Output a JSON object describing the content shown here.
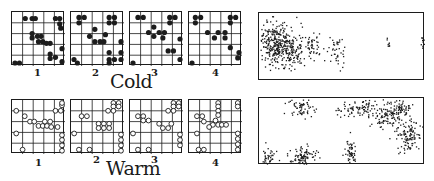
{
  "figure": {
    "panels": [
      {
        "condition": "Cold",
        "label": "Cold",
        "marker": "filled",
        "grids": [
          {
            "number": "1",
            "dots": [
              [
                0.25,
                0.12
              ],
              [
                0.38,
                0.12
              ],
              [
                0.44,
                0.12
              ],
              [
                0.82,
                0.12
              ],
              [
                0.9,
                0.12
              ],
              [
                0.9,
                0.22
              ],
              [
                0.92,
                0.3
              ],
              [
                0.38,
                0.4
              ],
              [
                0.38,
                0.48
              ],
              [
                0.48,
                0.45
              ],
              [
                0.55,
                0.45
              ],
              [
                0.5,
                0.55
              ],
              [
                0.58,
                0.55
              ],
              [
                0.65,
                0.58
              ],
              [
                0.72,
                0.58
              ],
              [
                0.96,
                0.68
              ],
              [
                0.72,
                0.78
              ],
              [
                0.72,
                0.86
              ],
              [
                0.82,
                0.84
              ],
              [
                0.96,
                0.92
              ],
              [
                0.05,
                0.96
              ],
              [
                0.14,
                0.96
              ]
            ]
          },
          {
            "number": "2",
            "dots": [
              [
                0.15,
                0.1
              ],
              [
                0.25,
                0.1
              ],
              [
                0.15,
                0.2
              ],
              [
                0.72,
                0.1
              ],
              [
                0.82,
                0.1
              ],
              [
                0.72,
                0.2
              ],
              [
                0.82,
                0.2
              ],
              [
                0.45,
                0.32
              ],
              [
                0.35,
                0.45
              ],
              [
                0.45,
                0.55
              ],
              [
                0.55,
                0.55
              ],
              [
                0.62,
                0.55
              ],
              [
                0.65,
                0.42
              ],
              [
                0.95,
                0.55
              ],
              [
                0.72,
                0.75
              ],
              [
                0.95,
                0.75
              ],
              [
                0.05,
                0.88
              ],
              [
                0.12,
                0.96
              ],
              [
                0.72,
                0.88
              ],
              [
                0.72,
                0.96
              ],
              [
                0.82,
                0.88
              ],
              [
                0.95,
                0.88
              ]
            ]
          },
          {
            "number": "3",
            "dots": [
              [
                0.15,
                0.1
              ],
              [
                0.25,
                0.1
              ],
              [
                0.75,
                0.1
              ],
              [
                0.85,
                0.1
              ],
              [
                0.75,
                0.2
              ],
              [
                0.45,
                0.28
              ],
              [
                0.35,
                0.38
              ],
              [
                0.45,
                0.45
              ],
              [
                0.55,
                0.38
              ],
              [
                0.65,
                0.38
              ],
              [
                0.62,
                0.48
              ],
              [
                0.95,
                0.5
              ],
              [
                0.72,
                0.72
              ],
              [
                0.82,
                0.72
              ],
              [
                0.95,
                0.88
              ],
              [
                0.05,
                0.96
              ]
            ]
          },
          {
            "number": "4",
            "dots": [
              [
                0.12,
                0.1
              ],
              [
                0.22,
                0.1
              ],
              [
                0.12,
                0.2
              ],
              [
                0.78,
                0.1
              ],
              [
                0.88,
                0.1
              ],
              [
                0.78,
                0.2
              ],
              [
                0.35,
                0.38
              ],
              [
                0.48,
                0.48
              ],
              [
                0.55,
                0.38
              ],
              [
                0.68,
                0.38
              ],
              [
                0.68,
                0.48
              ],
              [
                0.78,
                0.66
              ],
              [
                0.95,
                0.75
              ],
              [
                0.92,
                0.85
              ],
              [
                0.05,
                0.96
              ]
            ]
          }
        ],
        "scatter": {
          "clusters": [
            {
              "cx": 0.1,
              "cy": 0.45,
              "rx": 0.1,
              "ry": 0.28,
              "n": 320
            },
            {
              "cx": 0.2,
              "cy": 0.55,
              "rx": 0.08,
              "ry": 0.25,
              "n": 90
            },
            {
              "cx": 0.32,
              "cy": 0.45,
              "rx": 0.05,
              "ry": 0.18,
              "n": 50
            },
            {
              "cx": 0.47,
              "cy": 0.58,
              "rx": 0.05,
              "ry": 0.2,
              "n": 40
            },
            {
              "cx": 0.78,
              "cy": 0.43,
              "rx": 0.015,
              "ry": 0.06,
              "n": 8
            },
            {
              "cx": 0.98,
              "cy": 0.42,
              "rx": 0.015,
              "ry": 0.1,
              "n": 10
            }
          ]
        }
      },
      {
        "condition": "Warm",
        "label": "Warm",
        "marker": "open",
        "grids": [
          {
            "number": "1",
            "dots": [
              [
                0.08,
                0.2
              ],
              [
                0.24,
                0.3
              ],
              [
                0.34,
                0.4
              ],
              [
                0.42,
                0.4
              ],
              [
                0.5,
                0.48
              ],
              [
                0.58,
                0.48
              ],
              [
                0.66,
                0.48
              ],
              [
                0.62,
                0.4
              ],
              [
                0.72,
                0.4
              ],
              [
                0.74,
                0.5
              ],
              [
                0.86,
                0.5
              ],
              [
                0.82,
                0.2
              ],
              [
                0.92,
                0.2
              ],
              [
                0.96,
                0.1
              ],
              [
                0.96,
                0.02
              ],
              [
                0.08,
                0.62
              ],
              [
                0.96,
                0.65
              ],
              [
                0.96,
                0.74
              ],
              [
                0.96,
                0.84
              ],
              [
                0.96,
                0.94
              ],
              [
                0.2,
                0.92
              ]
            ]
          },
          {
            "number": "2",
            "dots": [
              [
                0.2,
                0.3
              ],
              [
                0.3,
                0.3
              ],
              [
                0.06,
                0.62
              ],
              [
                0.52,
                0.44
              ],
              [
                0.62,
                0.44
              ],
              [
                0.72,
                0.44
              ],
              [
                0.52,
                0.52
              ],
              [
                0.62,
                0.52
              ],
              [
                0.72,
                0.52
              ],
              [
                0.8,
                0.04
              ],
              [
                0.9,
                0.04
              ],
              [
                0.8,
                0.12
              ],
              [
                0.9,
                0.12
              ],
              [
                0.7,
                0.2
              ],
              [
                0.8,
                0.2
              ],
              [
                0.95,
                0.64
              ],
              [
                0.95,
                0.74
              ],
              [
                0.95,
                0.84
              ],
              [
                0.95,
                0.94
              ],
              [
                0.15,
                0.92
              ],
              [
                0.35,
                0.92
              ]
            ]
          },
          {
            "number": "3",
            "dots": [
              [
                0.15,
                0.3
              ],
              [
                0.25,
                0.3
              ],
              [
                0.25,
                0.38
              ],
              [
                0.35,
                0.38
              ],
              [
                0.05,
                0.62
              ],
              [
                0.55,
                0.44
              ],
              [
                0.62,
                0.52
              ],
              [
                0.72,
                0.52
              ],
              [
                0.78,
                0.44
              ],
              [
                0.82,
                0.04
              ],
              [
                0.92,
                0.04
              ],
              [
                0.82,
                0.12
              ],
              [
                0.92,
                0.12
              ],
              [
                0.72,
                0.2
              ],
              [
                0.82,
                0.2
              ],
              [
                0.95,
                0.64
              ],
              [
                0.95,
                0.74
              ],
              [
                0.95,
                0.84
              ],
              [
                0.15,
                0.92
              ],
              [
                0.35,
                0.92
              ]
            ]
          },
          {
            "number": "4",
            "dots": [
              [
                0.15,
                0.3
              ],
              [
                0.25,
                0.3
              ],
              [
                0.28,
                0.4
              ],
              [
                0.15,
                0.62
              ],
              [
                0.55,
                0.04
              ],
              [
                0.55,
                0.12
              ],
              [
                0.55,
                0.2
              ],
              [
                0.55,
                0.28
              ],
              [
                0.5,
                0.38
              ],
              [
                0.45,
                0.46
              ],
              [
                0.55,
                0.46
              ],
              [
                0.62,
                0.46
              ],
              [
                0.7,
                0.46
              ],
              [
                0.38,
                0.5
              ],
              [
                0.92,
                0.04
              ],
              [
                0.92,
                0.12
              ],
              [
                0.92,
                0.62
              ],
              [
                0.92,
                0.72
              ],
              [
                0.92,
                0.82
              ],
              [
                0.92,
                0.92
              ],
              [
                0.18,
                0.92
              ],
              [
                0.28,
                0.92
              ]
            ]
          }
        ],
        "scatter": {
          "clusters": [
            {
              "cx": 0.05,
              "cy": 0.88,
              "rx": 0.04,
              "ry": 0.1,
              "n": 40
            },
            {
              "cx": 0.26,
              "cy": 0.85,
              "rx": 0.08,
              "ry": 0.14,
              "n": 90
            },
            {
              "cx": 0.55,
              "cy": 0.82,
              "rx": 0.03,
              "ry": 0.2,
              "n": 55
            },
            {
              "cx": 0.25,
              "cy": 0.15,
              "rx": 0.07,
              "ry": 0.12,
              "n": 60
            },
            {
              "cx": 0.58,
              "cy": 0.15,
              "rx": 0.1,
              "ry": 0.12,
              "n": 80
            },
            {
              "cx": 0.78,
              "cy": 0.25,
              "rx": 0.1,
              "ry": 0.2,
              "n": 110
            },
            {
              "cx": 0.9,
              "cy": 0.55,
              "rx": 0.07,
              "ry": 0.22,
              "n": 110
            },
            {
              "cx": 0.85,
              "cy": 0.15,
              "rx": 0.05,
              "ry": 0.1,
              "n": 50
            }
          ]
        }
      }
    ]
  },
  "colors": {
    "ink": "#1c1c1c",
    "background": "#ffffff"
  }
}
